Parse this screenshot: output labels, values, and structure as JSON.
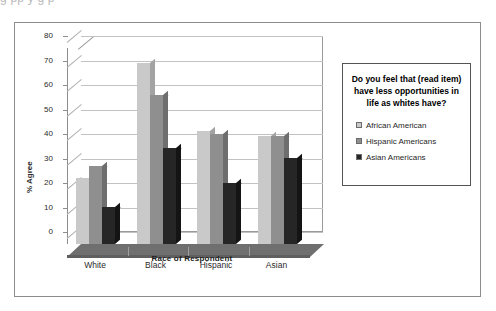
{
  "caption_ghost": "g                                    pp    y    g                      p",
  "chart_data": {
    "type": "bar",
    "title": "",
    "legend_title": "Do you feel that (read item) have less opportunities in life as whites have?",
    "xlabel": "Race of Respondent",
    "ylabel": "% Agree",
    "ylim": [
      0,
      80
    ],
    "yticks": [
      80,
      70,
      60,
      50,
      40,
      30,
      20,
      10,
      0
    ],
    "categories": [
      "White",
      "Black",
      "Hispanic",
      "Asian"
    ],
    "grid": true,
    "legend_position": "right",
    "style": "3d-column",
    "series": [
      {
        "name": "African American",
        "color": "#c9c9c9",
        "values": [
          27,
          74,
          46,
          44
        ]
      },
      {
        "name": "Hispanic Americans",
        "color": "#8f8f8f",
        "values": [
          32,
          61,
          45,
          44
        ]
      },
      {
        "name": "Asian Americans",
        "color": "#262626",
        "values": [
          15,
          39,
          25,
          35
        ]
      }
    ]
  },
  "legend": {
    "title": "Do you feel that (read item) have less opportunities in life as whites have?",
    "items": [
      {
        "label": "African American"
      },
      {
        "label": "Hispanic Americans"
      },
      {
        "label": "Asian Americans"
      }
    ]
  },
  "colors": {
    "series1": "#c9c9c9",
    "series2": "#8f8f8f",
    "series3": "#262626",
    "frame": "#8d8d8d",
    "gridline": "#c2c2c2",
    "floor": "#6f6f6f"
  }
}
